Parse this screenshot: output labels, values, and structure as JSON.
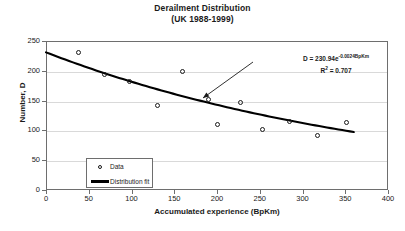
{
  "chart_data": {
    "type": "scatter",
    "title": "Derailment Distribution",
    "subtitle": "(UK 1988-1999)",
    "xlabel": "Accumulated experience (BpKm)",
    "ylabel": "Number, D",
    "xlim": [
      0,
      400
    ],
    "ylim": [
      0,
      250
    ],
    "xticks": [
      0,
      50,
      100,
      150,
      200,
      250,
      300,
      350,
      400
    ],
    "yticks": [
      0,
      50,
      100,
      150,
      200,
      250
    ],
    "grid": "horizontal",
    "legend_position": "bottom-left",
    "series": [
      {
        "name": "Data",
        "marker": "open-circle",
        "points": [
          {
            "x": 38,
            "y": 230
          },
          {
            "x": 68,
            "y": 193
          },
          {
            "x": 98,
            "y": 182
          },
          {
            "x": 130,
            "y": 142
          },
          {
            "x": 160,
            "y": 199
          },
          {
            "x": 190,
            "y": 152
          },
          {
            "x": 200,
            "y": 110
          },
          {
            "x": 228,
            "y": 147
          },
          {
            "x": 253,
            "y": 101
          },
          {
            "x": 285,
            "y": 115
          },
          {
            "x": 318,
            "y": 92
          },
          {
            "x": 352,
            "y": 113
          }
        ]
      },
      {
        "name": "Distribution fit",
        "marker": "line",
        "equation": "D = 230.94e^(-0.0024 BpKm)",
        "coefficient": 230.94,
        "exponent_rate": -0.0024,
        "r_squared": 0.707,
        "x_start": 0,
        "x_end": 360
      }
    ],
    "annotations": [
      {
        "name": "fit-equation",
        "line1_prefix": "D = 230.94e",
        "line1_exponent": "-0.0024BpKm",
        "line2_prefix": "R",
        "line2_sup": "2",
        "line2_value": " = 0.707"
      },
      {
        "name": "callout-arrow",
        "from_x": 253,
        "from_y": 62,
        "to_x": 203,
        "to_y": 98,
        "points_to": "distribution-fit-curve"
      }
    ]
  },
  "legend": {
    "items": [
      {
        "label": "Data",
        "key": "open-circle"
      },
      {
        "label": "Distribution fit",
        "key": "thick-line"
      }
    ]
  },
  "colors": {
    "frame": "#6e6e6e",
    "grid": "#d9d9d9",
    "marker": "#1a1a1a",
    "fit_line": "#000000",
    "background": "#ffffff"
  }
}
